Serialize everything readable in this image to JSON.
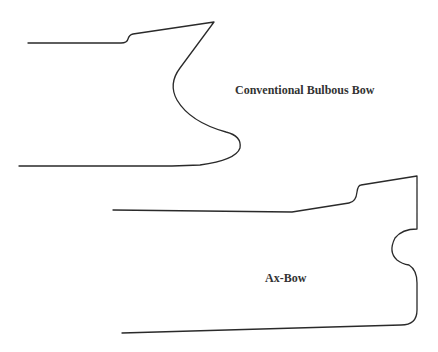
{
  "diagram": {
    "figures": [
      {
        "id": "conventional",
        "label": "Conventional Bulbous Bow",
        "path": "M28,43 L121,43 Q127,43 128,39 Q129,35 133,34 L214,22 L180,68 Q168,84 177,100 Q190,122 226,132 Q242,136 240,148 Q236,160 200,165 L172,166 L19,166"
      },
      {
        "id": "axbow",
        "label": "Ax-Bow",
        "path": "M113,210 L292,212 L349,203 Q356,202 357,192 Q358,185 361,185 L417,176 L417,229 Q402,229 395,238 Q388,252 397,260 Q402,264 409,265 Q417,270 417,283 L417,310 Q417,325 401,325 L122,333"
      }
    ],
    "stroke_color": "#2a2a2a",
    "background": "#ffffff"
  }
}
